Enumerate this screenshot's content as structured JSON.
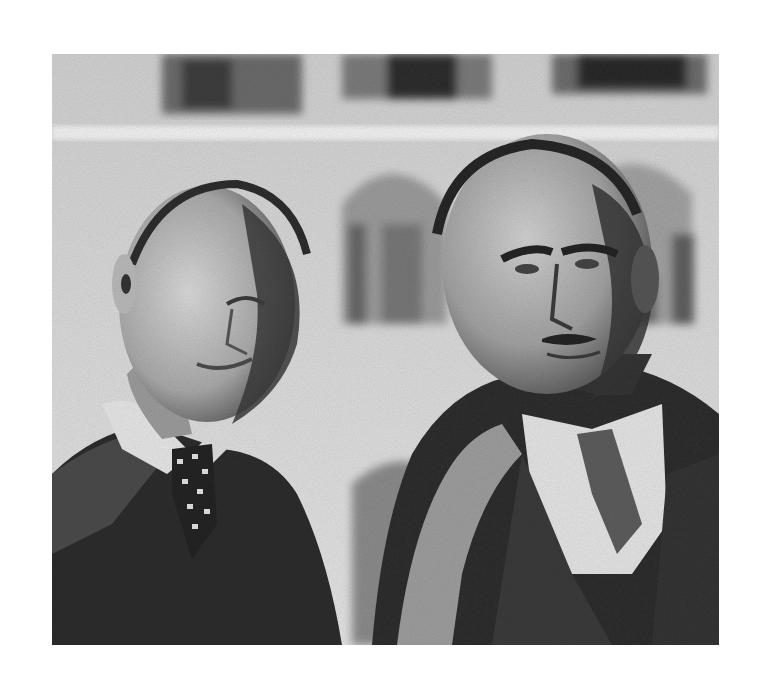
{
  "image": {
    "kind": "black-and-white photograph",
    "subjects": 2,
    "palette": {
      "background": "#ffffff",
      "wall": "#d6d6d6",
      "window_dark": "#4a4a4a",
      "coat_dark": "#2a2a2a",
      "skin_light": "#cfcfcf",
      "skin_shadow": "#5e5e5e",
      "shirt": "#e6e6e6"
    }
  }
}
